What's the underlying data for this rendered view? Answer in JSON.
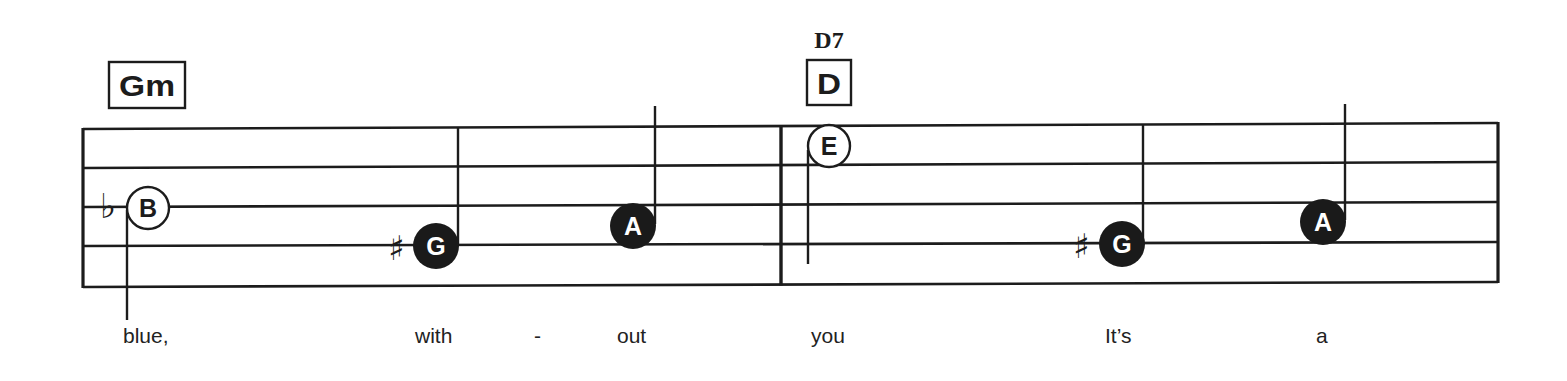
{
  "colors": {
    "ink": "#1c1c1c",
    "paper": "#ffffff",
    "filled_note": "#1a1a1a",
    "filled_note_text": "#ffffff"
  },
  "staff": {
    "left_x": 83,
    "right_x": 1498,
    "barline_x": 781,
    "lines_left_y": [
      129,
      168,
      207,
      246,
      287
    ],
    "lines_right_y": [
      123,
      162,
      202,
      242,
      282
    ]
  },
  "chords": [
    {
      "symbol_box": "Gm",
      "box": {
        "x": 109,
        "y": 62,
        "w": 76,
        "h": 46
      },
      "symbol_above": ""
    },
    {
      "symbol_box": "D",
      "box": {
        "x": 807,
        "y": 60,
        "w": 44,
        "h": 45
      },
      "symbol_above": "D7"
    }
  ],
  "notes": [
    {
      "letter": "B",
      "style": "open",
      "cx": 148,
      "cy": 208,
      "accidental": "flat",
      "acc_x": 100,
      "stem": {
        "x": 127,
        "y1": 210,
        "y2": 320
      }
    },
    {
      "letter": "G",
      "style": "filled",
      "cx": 436,
      "cy": 246,
      "accidental": "sharp",
      "acc_x": 388,
      "stem": {
        "x": 458,
        "y1": 127,
        "y2": 244
      }
    },
    {
      "letter": "A",
      "style": "filled",
      "cx": 633,
      "cy": 226,
      "accidental": "",
      "acc_x": 0,
      "stem": {
        "x": 655,
        "y1": 106,
        "y2": 224
      }
    },
    {
      "letter": "E",
      "style": "open",
      "cx": 829,
      "cy": 146,
      "accidental": "",
      "acc_x": 0,
      "stem": {
        "x": 808,
        "y1": 150,
        "y2": 264
      }
    },
    {
      "letter": "G",
      "style": "filled",
      "cx": 1122,
      "cy": 244,
      "accidental": "sharp",
      "acc_x": 1073,
      "stem": {
        "x": 1143,
        "y1": 124,
        "y2": 242
      }
    },
    {
      "letter": "A",
      "style": "filled",
      "cx": 1323,
      "cy": 222,
      "accidental": "",
      "acc_x": 0,
      "stem": {
        "x": 1345,
        "y1": 104,
        "y2": 220
      }
    }
  ],
  "lyrics": [
    {
      "text": "blue,",
      "x": 123
    },
    {
      "text": "with",
      "x": 415
    },
    {
      "text": "-",
      "x": 534
    },
    {
      "text": "out",
      "x": 617
    },
    {
      "text": "you",
      "x": 811
    },
    {
      "text": "It’s",
      "x": 1105
    },
    {
      "text": "a",
      "x": 1316
    }
  ],
  "lyrics_baseline_y": 343
}
